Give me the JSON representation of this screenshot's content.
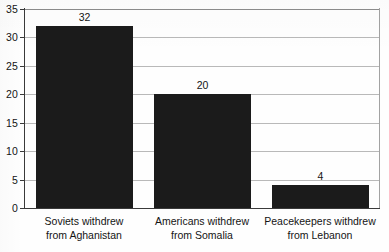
{
  "chart_data": {
    "type": "bar",
    "title": "",
    "subtitle": "",
    "xlabel": "",
    "ylabel": "",
    "categories": [
      "Soviets withdrew from Aghanistan",
      "Americans withdrew from Somalia",
      "Peacekeepers withdrew from Lebanon"
    ],
    "category_lines": [
      [
        "Soviets withdrew",
        "from Aghanistan"
      ],
      [
        "Americans withdrew",
        "from Somalia"
      ],
      [
        "Peacekeepers withdrew",
        "from Lebanon"
      ]
    ],
    "values": [
      32,
      20,
      4
    ],
    "value_labels": [
      "32",
      "20",
      "4"
    ],
    "ylim": [
      0,
      35
    ],
    "ytick_values": [
      0,
      5,
      10,
      15,
      20,
      25,
      30,
      35
    ],
    "ytick_labels": [
      "0",
      "5",
      "10",
      "15",
      "20",
      "25",
      "30",
      "35"
    ],
    "grid": true,
    "grid_axis": "y",
    "legend": false,
    "legend_position": "none",
    "bar_color": "#1b1b1b",
    "gridline_color": "#b9b9b9",
    "axis_color": "#3a3a3a",
    "background_color": "#fefefe",
    "text_color": "#141414"
  }
}
